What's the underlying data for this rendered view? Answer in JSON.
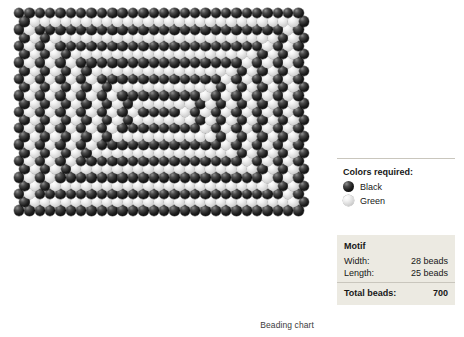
{
  "chart": {
    "caption": "Beading chart",
    "grid": {
      "columns": 28,
      "rows": 25,
      "bead_diameter": 10.4,
      "row_offset": 5.2,
      "colors": {
        "black": "#141414",
        "green": "#e2e2e2"
      },
      "pattern": [
        "1111111111111111111111111111",
        "1000000000000000000000000001",
        "1011111111111111111111111101",
        "1010000000000000000000000101",
        "1010111111111111111111110101",
        "1010100000000000000000010101",
        "1010101111111111111111010101",
        "1010101000000000000001010101",
        "1010101011111111111101010101",
        "1010101010000000000101010101",
        "1010101010111111110101010101",
        "1010101010100000010101010101",
        "1010101010101111010101010101",
        "1010101010100000010101010101",
        "1010101010111111110101010101",
        "1010101010000000000101010101",
        "1010101011111111111101010101",
        "1010101000000000000001010101",
        "1010101111111111111111010101",
        "1010100000000000000000010101",
        "1010111111111111111111110101",
        "1010000000000000000000000101",
        "1011111111111111111111111101",
        "1000000000000000000000000001",
        "1111111111111111111111111111"
      ]
    }
  },
  "legend": {
    "title": "Colors required:",
    "items": [
      {
        "swatch": "black",
        "label": "Black"
      },
      {
        "swatch": "green",
        "label": "Green"
      }
    ]
  },
  "motif": {
    "title": "Motif",
    "rows": [
      {
        "label": "Width:",
        "value": "28 beads"
      },
      {
        "label": "Length:",
        "value": "25 beads"
      }
    ],
    "total": {
      "label": "Total beads:",
      "value": "700"
    }
  }
}
